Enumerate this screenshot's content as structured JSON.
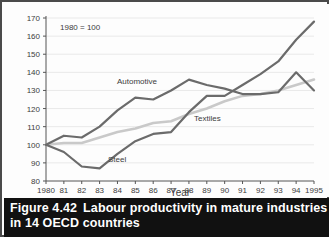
{
  "figure": {
    "caption_number": "Figure 4.42",
    "caption_line1": "Labour productivity in mature industries",
    "caption_line2": "in 14 OECD countries",
    "note": "1980 = 100"
  },
  "colors": {
    "frame": "#4a4a4a",
    "caption_background": "#111111",
    "caption_text": "#ffffff",
    "axis": "#555555",
    "grid": "#e9e9e9",
    "automotive": "#6b6b6b",
    "steel": "#6b6b6b",
    "textiles": "#c9c9c9",
    "plot_background": "#fdfdfd"
  },
  "chart_data": {
    "type": "line",
    "title": "Labour productivity in mature industries in 14 OECD countries",
    "subtitle": "1980 = 100",
    "xlabel": "Year",
    "ylabel": "",
    "xlim": [
      1980,
      1995
    ],
    "ylim": [
      80,
      170
    ],
    "ytick_step": 10,
    "yticks": [
      80,
      90,
      100,
      110,
      120,
      130,
      140,
      150,
      160,
      170
    ],
    "x": [
      1980,
      1981,
      1982,
      1983,
      1984,
      1985,
      1986,
      1987,
      1988,
      1989,
      1990,
      1991,
      1992,
      1993,
      1994,
      1995
    ],
    "xtick_labels": [
      "1980",
      "81",
      "82",
      "83",
      "84",
      "85",
      "86",
      "87",
      "88",
      "89",
      "90",
      "91",
      "92",
      "93",
      "94",
      "1995"
    ],
    "grid": true,
    "legend": "inline-labels",
    "series": [
      {
        "name": "Automotive",
        "color": "#6b6b6b",
        "values": [
          100,
          105,
          104,
          110,
          119,
          126,
          125,
          130,
          136,
          133,
          131,
          128,
          128,
          129,
          140,
          130
        ]
      },
      {
        "name": "Steel",
        "color": "#6b6b6b",
        "values": [
          100,
          96,
          88,
          87,
          95,
          102,
          106,
          107,
          118,
          127,
          127,
          133,
          139,
          146,
          158,
          168
        ]
      },
      {
        "name": "Textiles",
        "color": "#c9c9c9",
        "values": [
          100,
          101,
          101,
          104,
          107,
          109,
          112,
          113,
          117,
          120,
          124,
          127,
          128,
          130,
          133,
          136
        ]
      }
    ],
    "annotations": [
      {
        "text": "Automotive",
        "series": "Automotive"
      },
      {
        "text": "Textiles",
        "series": "Textiles"
      },
      {
        "text": "Steel",
        "series": "Steel"
      }
    ]
  }
}
